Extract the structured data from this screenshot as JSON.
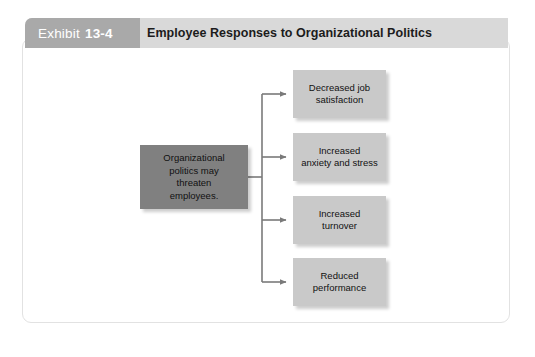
{
  "header": {
    "exhibit_word": "Exhibit",
    "exhibit_number": "13-4",
    "title": "Employee Responses to Organizational Politics"
  },
  "diagram": {
    "type": "flow-diagram",
    "source": {
      "label": "Organizational politics may threaten employees.",
      "line1": "Organizational",
      "line2": "politics may",
      "line3": "threaten",
      "line4": "employees.",
      "color": "#808080"
    },
    "outcomes": [
      {
        "label": "Decreased job satisfaction",
        "line1": "Decreased job",
        "line2": "satisfaction",
        "color": "#c9c9c9"
      },
      {
        "label": "Increased anxiety and stress",
        "line1": "Increased",
        "line2": "anxiety and stress",
        "color": "#c9c9c9"
      },
      {
        "label": "Increased turnover",
        "line1": "Increased",
        "line2": "turnover",
        "color": "#c9c9c9"
      },
      {
        "label": "Reduced performance",
        "line1": "Reduced",
        "line2": "performance",
        "color": "#c9c9c9"
      }
    ],
    "connector_color": "#7a7a7a"
  },
  "colors": {
    "card_background": "#ffffff",
    "card_border": "#e2e2e2",
    "header_bar": "#d9d9d9",
    "exhibit_tab": "#a9a9a9",
    "title_text": "#1c1c1c",
    "page_background": "#ffffff"
  }
}
